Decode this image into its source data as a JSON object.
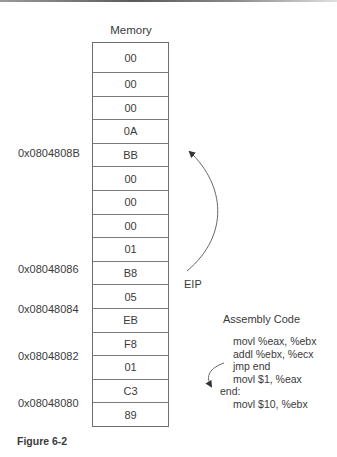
{
  "memory": {
    "title": "Memory",
    "cells": [
      "00",
      "00",
      "00",
      "0A",
      "BB",
      "00",
      "00",
      "00",
      "01",
      "B8",
      "05",
      "EB",
      "F8",
      "01",
      "C3",
      "89"
    ]
  },
  "addresses": [
    {
      "label": "0x0804808B",
      "row": 4
    },
    {
      "label": "0x08048086",
      "row": 9
    },
    {
      "label": "0x08048084",
      "row": 11
    },
    {
      "label": "0x08048082",
      "row": 13
    },
    {
      "label": "0x08048080",
      "row": 15
    }
  ],
  "eip_label": "EIP",
  "assembly": {
    "title": "Assembly Code",
    "lines": [
      "movl %eax, %ebx",
      "addl %ebx, %ecx",
      "jmp end",
      "movl $1, %eax",
      "end:",
      "movl $10, %ebx"
    ]
  },
  "figure_caption": "Figure 6-2"
}
